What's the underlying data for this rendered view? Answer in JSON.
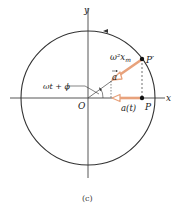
{
  "figure": {
    "caption": "(c)",
    "axes": {
      "x_label": "x",
      "y_label": "y",
      "origin_label": "O"
    },
    "points": {
      "p_prime": "P′",
      "p": "P"
    },
    "labels": {
      "magnitude": "ω²x",
      "magnitude_sub": "m",
      "vector": "a",
      "phase": "ωt + ϕ",
      "projection": "a(t)"
    },
    "colors": {
      "arrow": "#e8a27c",
      "arrow_fill": "#ffffff",
      "line": "#333333"
    },
    "rotation_direction": "counterclockwise"
  }
}
